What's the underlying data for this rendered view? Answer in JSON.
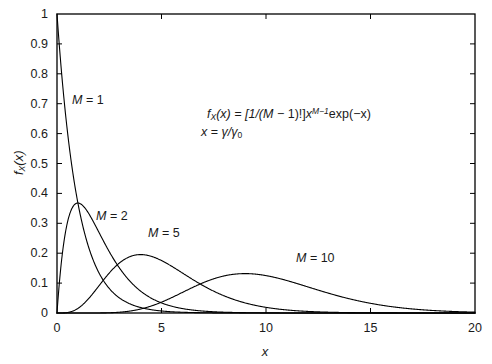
{
  "figure": {
    "annotations": {
      "equation_line1_parts": {
        "f": "f",
        "sub_x": "X",
        "arg": "(x) = [1/(",
        "m": "M",
        "mid": " − 1)!]",
        "x": "x",
        "exp_sup": "M−1",
        "tail": "exp(−x)"
      },
      "equation_line1_plain": "f_X(x) = [1/(M − 1)!]x^(M−1)exp(−x)",
      "equation_line2_plain": "x = γ/γ₀",
      "equation_line2_parts": {
        "x": "x",
        "eq": " = ",
        "gamma": "γ/γ",
        "sub0": "0"
      }
    },
    "curve_labels": [
      {
        "prefix": "M",
        "text": " = 1",
        "full": "M = 1"
      },
      {
        "prefix": "M",
        "text": " = 2",
        "full": "M = 2"
      },
      {
        "prefix": "M",
        "text": " = 5",
        "full": "M = 5"
      },
      {
        "prefix": "M",
        "text": " = 10",
        "full": "M = 10"
      }
    ],
    "axis_label_x": "x",
    "axis_label_y_parts": {
      "f": "f",
      "sub": "X",
      "arg": "(x)"
    },
    "axis_label_y_plain": "f_X(x)"
  },
  "chart_data": {
    "type": "line",
    "title": "",
    "subtitle": "",
    "xlabel": "x",
    "ylabel": "f_X(x)",
    "xlim": [
      0,
      20
    ],
    "ylim": [
      0,
      1
    ],
    "xticks": [
      0,
      5,
      10,
      15,
      20
    ],
    "xticklabels": [
      "0",
      "5",
      "10",
      "15",
      "20"
    ],
    "yticks": [
      0,
      0.1,
      0.2,
      0.3,
      0.4,
      0.5,
      0.6,
      0.7,
      0.8,
      0.9,
      1
    ],
    "yticklabels": [
      "0",
      "0.1",
      "0.2",
      "0.3",
      "0.4",
      "0.5",
      "0.6",
      "0.7",
      "0.8",
      "0.9",
      "1"
    ],
    "grid": false,
    "legend": "inline-curve-labels",
    "line_color": "#000000",
    "line_width": 1.1,
    "equation": "f_X(x) = [1/(M − 1)!] x^(M−1) exp(−x),   x = γ/γ0",
    "series": [
      {
        "name": "M = 1",
        "M": 1,
        "peak_x": 0,
        "peak_y": 1.0,
        "label_pos": {
          "x": 1.1,
          "y": 0.73
        },
        "x": [
          0,
          0.25,
          0.5,
          0.75,
          1,
          1.25,
          1.5,
          1.75,
          2,
          2.5,
          3,
          3.5,
          4,
          4.5,
          5,
          6,
          7,
          8,
          9,
          10,
          11,
          12,
          13,
          14,
          15,
          16,
          17,
          18,
          19,
          20
        ],
        "y": [
          1,
          0.7788,
          0.6065,
          0.4724,
          0.3679,
          0.2865,
          0.2231,
          0.1738,
          0.1353,
          0.0821,
          0.0498,
          0.0302,
          0.0183,
          0.0111,
          0.0067,
          0.0025,
          0.0009,
          0.0003,
          0.0001,
          0.0,
          0,
          0,
          0,
          0,
          0,
          0,
          0,
          0,
          0,
          0
        ]
      },
      {
        "name": "M = 2",
        "M": 2,
        "peak_x": 1,
        "peak_y": 0.3679,
        "label_pos": {
          "x": 2.2,
          "y": 0.345
        },
        "x": [
          0,
          0.25,
          0.5,
          0.75,
          1,
          1.25,
          1.5,
          1.75,
          2,
          2.5,
          3,
          3.5,
          4,
          4.5,
          5,
          6,
          7,
          8,
          9,
          10,
          11,
          12,
          13,
          14,
          15,
          16,
          17,
          18,
          19,
          20
        ],
        "y": [
          0,
          0.1947,
          0.3033,
          0.3543,
          0.3679,
          0.3581,
          0.3347,
          0.3041,
          0.2707,
          0.2052,
          0.1494,
          0.1057,
          0.0733,
          0.05,
          0.0337,
          0.0149,
          0.0064,
          0.0027,
          0.0011,
          0.0005,
          0.0002,
          0.0001,
          0.0,
          0,
          0,
          0,
          0,
          0,
          0,
          0
        ]
      },
      {
        "name": "M = 5",
        "M": 5,
        "peak_x": 4,
        "peak_y": 0.1954,
        "label_pos": {
          "x": 5.6,
          "y": 0.215
        },
        "x": [
          0,
          0.5,
          1,
          1.5,
          2,
          2.5,
          3,
          3.5,
          4,
          4.5,
          5,
          5.5,
          6,
          6.5,
          7,
          8,
          9,
          10,
          11,
          12,
          13,
          14,
          15,
          16,
          17,
          18,
          19,
          20
        ],
        "y": [
          0,
          0.0016,
          0.0153,
          0.047,
          0.0902,
          0.1336,
          0.168,
          0.1888,
          0.1954,
          0.1898,
          0.1755,
          0.1558,
          0.1339,
          0.1118,
          0.0912,
          0.0573,
          0.0337,
          0.0189,
          0.0102,
          0.0053,
          0.0027,
          0.0013,
          0.0006,
          0.0003,
          0.0001,
          0.0001,
          0.0,
          0
        ]
      },
      {
        "name": "M = 10",
        "M": 10,
        "peak_x": 9,
        "peak_y": 0.1318,
        "label_pos": {
          "x": 10.3,
          "y": 0.145
        },
        "x": [
          0,
          1,
          2,
          3,
          4,
          5,
          6,
          7,
          8,
          9,
          10,
          11,
          12,
          13,
          14,
          15,
          16,
          17,
          18,
          19,
          20
        ],
        "y": [
          0,
          0.0,
          0.0002,
          0.0038,
          0.0186,
          0.0454,
          0.0688,
          0.081,
          0.0993,
          0.1186,
          0.1251,
          0.1194,
          0.1048,
          0.0859,
          0.0663,
          0.0486,
          0.0341,
          0.023,
          0.015,
          0.0095,
          0.0058
        ]
      }
    ]
  }
}
